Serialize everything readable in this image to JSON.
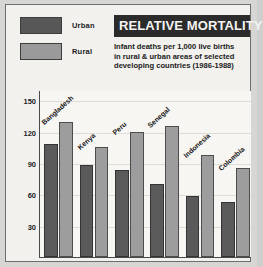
{
  "title": "RELATIVE MORTALITY",
  "subtitle_lines": [
    "Infant deaths per 1,000 live births",
    "in rural & urban areas of selected",
    "developing countries (1986-1988)"
  ],
  "legend": [
    {
      "label": "Urban",
      "color": "#575757",
      "key": "urban"
    },
    {
      "label": "Rural",
      "color": "#9a9a9a",
      "key": "rural"
    }
  ],
  "colors": {
    "urban": "#5a5a5a",
    "rural": "#9d9d9d",
    "title_bar_bg": "#2b2b2b",
    "title_bar_text": "#f4f4f2",
    "card_bg": "#f2f1ee",
    "plot_bg": "#f7f6f3",
    "border": "#6e6e6c"
  },
  "chart_data": {
    "type": "bar",
    "title": "RELATIVE MORTALITY",
    "subtitle": "Infant deaths per 1,000 live births in rural & urban areas of selected developing countries (1986-1988)",
    "xlabel": "",
    "ylabel": "",
    "ylim": [
      0,
      160
    ],
    "yticks": [
      30,
      60,
      90,
      120,
      150
    ],
    "grid": true,
    "legend_position": "top-left",
    "categories": [
      "Bangladesh",
      "Kenya",
      "Peru",
      "Senegal",
      "Indonesia",
      "Colombia"
    ],
    "series": [
      {
        "name": "Urban",
        "values": [
          108,
          88,
          83,
          70,
          58,
          53
        ]
      },
      {
        "name": "Rural",
        "values": [
          129,
          105,
          120,
          126,
          98,
          85
        ]
      }
    ]
  }
}
